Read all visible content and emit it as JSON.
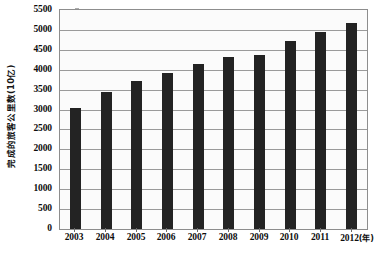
{
  "chart_data": {
    "type": "bar",
    "title": "",
    "subtitle": "",
    "xlabel": "年",
    "ylabel": "完成的旅客公里数(10亿)",
    "categories": [
      "2003",
      "2004",
      "2005",
      "2006",
      "2007",
      "2008",
      "2009",
      "2010",
      "2011",
      "2012"
    ],
    "values": [
      3040,
      3440,
      3710,
      3930,
      4140,
      4330,
      4360,
      4710,
      4950,
      5170
    ],
    "series": [
      {
        "name": "完成的旅客公里数",
        "values": [
          3040,
          3440,
          3710,
          3930,
          4140,
          4330,
          4360,
          4710,
          4950,
          5170
        ]
      }
    ],
    "ylim": [
      0,
      5500
    ],
    "ytick_values": [
      0,
      500,
      1000,
      1500,
      2000,
      2500,
      3000,
      3500,
      4000,
      4500,
      5000,
      5500
    ],
    "ytick_labels": [
      "0",
      "500",
      "1000",
      "1500",
      "2000",
      "2500",
      "3000",
      "3500",
      "4000",
      "4500",
      "5000",
      "5500"
    ],
    "xtick_labels": [
      "2003",
      "2004",
      "2005",
      "2006",
      "2007",
      "2008",
      "2009",
      "2010",
      "2011",
      "2012"
    ],
    "x_axis_unit_suffix": "(年)",
    "grid": true,
    "grid_orientation": "horizontal",
    "legend": false,
    "legend_position": "none",
    "annotations": [],
    "colors": {
      "bar": "#232323",
      "grid": "#9a9a9a",
      "axis": "#8d8d8d",
      "plot_background": "#fbfbfb",
      "figure_background": "#ffffff",
      "text": "#0d0d0d"
    }
  }
}
